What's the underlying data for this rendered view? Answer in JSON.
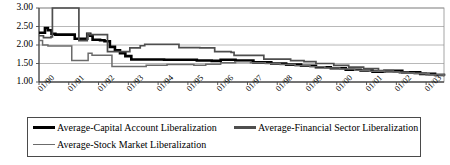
{
  "chart_data": {
    "type": "line",
    "title": "",
    "xlabel": "",
    "ylabel": "",
    "ylim": [
      1.0,
      3.0
    ],
    "ytick_labels": [
      "3.00",
      "2.50",
      "2.00",
      "1.50",
      "1.00"
    ],
    "ytick_values": [
      3.0,
      2.5,
      2.0,
      1.5,
      1.0
    ],
    "grid": "horizontal",
    "legend_position": "bottom",
    "x_axis_type": "monthly-date",
    "xtick_labels": [
      "01/90",
      "01/91",
      "01/92",
      "01/93",
      "01/94",
      "01/95",
      "01/96",
      "01/97",
      "01/98",
      "01/99",
      "01/00",
      "01/01",
      "01/02",
      "01/03"
    ],
    "xtick_values": [
      1990.0,
      1991.0,
      1992.0,
      1993.0,
      1994.0,
      1995.0,
      1996.0,
      1997.0,
      1998.0,
      1999.0,
      2000.0,
      2001.0,
      2002.0,
      2003.0
    ],
    "xlim": [
      1990.0,
      2003.6
    ],
    "series": [
      {
        "name": "Average-Capital Account Liberalization",
        "color": "#000000",
        "width": 2.6,
        "x": [
          1990.0,
          1990.2,
          1990.3,
          1990.42,
          1990.55,
          1991.1,
          1991.2,
          1991.55,
          1991.62,
          1991.72,
          1991.8,
          1992.05,
          1992.2,
          1992.38,
          1992.55,
          1992.72,
          1992.9,
          1993.1,
          1994.2,
          1995.3,
          1995.8,
          1996.1,
          1996.6,
          1997.2,
          1997.8,
          1998.3,
          1998.8,
          1999.3,
          1999.8,
          2000.3,
          2000.8,
          2001.2,
          2001.6,
          2001.9,
          2002.2,
          2002.8,
          2003.3,
          2003.6
        ],
        "y": [
          2.33,
          2.46,
          2.4,
          2.3,
          2.28,
          2.28,
          2.17,
          2.17,
          2.3,
          2.25,
          2.14,
          2.13,
          2.1,
          1.95,
          1.86,
          1.78,
          1.7,
          1.61,
          1.6,
          1.58,
          1.57,
          1.6,
          1.58,
          1.53,
          1.5,
          1.47,
          1.44,
          1.4,
          1.37,
          1.33,
          1.31,
          1.28,
          1.3,
          1.3,
          1.26,
          1.22,
          1.19,
          1.17
        ]
      },
      {
        "name": "Average-Financial Sector Liberalization",
        "color": "#4e4e4e",
        "width": 1.7,
        "x": [
          1990.0,
          1990.15,
          1990.4,
          1990.45,
          1991.28,
          1991.34,
          1991.5,
          1991.62,
          1991.7,
          1992.2,
          1992.3,
          1992.95,
          1993.05,
          1993.4,
          1993.55,
          1994.55,
          1994.7,
          1995.2,
          1995.4,
          1995.9,
          1996.05,
          1996.45,
          1996.55,
          1997.4,
          1997.55,
          1998.2,
          1998.45,
          1998.9,
          1999.3,
          1999.9,
          2000.4,
          2000.9,
          2001.4,
          2001.9,
          2002.4,
          2003.0,
          2003.6
        ],
        "y": [
          2.25,
          2.2,
          2.22,
          3.0,
          3.0,
          2.12,
          2.12,
          2.3,
          2.28,
          2.28,
          1.82,
          1.82,
          1.92,
          1.98,
          2.02,
          2.02,
          1.93,
          1.93,
          1.92,
          1.82,
          1.82,
          1.8,
          1.72,
          1.72,
          1.62,
          1.62,
          1.58,
          1.55,
          1.5,
          1.45,
          1.4,
          1.36,
          1.31,
          1.27,
          1.24,
          1.2,
          1.17
        ]
      },
      {
        "name": "Average-Stock Market Liberalization",
        "color": "#6b6b6b",
        "width": 1.5,
        "x": [
          1990.0,
          1990.12,
          1990.3,
          1990.95,
          1991.1,
          1991.55,
          1991.65,
          1991.78,
          1991.95,
          1992.3,
          1992.45,
          1993.1,
          1993.6,
          1994.3,
          1994.8,
          1995.2,
          1995.6,
          1996.1,
          1996.6,
          1997.1,
          1997.6,
          1998.1,
          1998.6,
          1999.1,
          1999.6,
          2000.1,
          2000.6,
          2001.1,
          2001.6,
          2002.1,
          2002.6,
          2003.1,
          2003.6
        ],
        "y": [
          2.12,
          2.0,
          1.97,
          1.97,
          1.58,
          1.58,
          1.78,
          1.72,
          1.72,
          1.72,
          1.42,
          1.42,
          1.45,
          1.47,
          1.47,
          1.45,
          1.48,
          1.52,
          1.55,
          1.52,
          1.5,
          1.47,
          1.44,
          1.41,
          1.38,
          1.35,
          1.32,
          1.29,
          1.27,
          1.24,
          1.22,
          1.19,
          1.15
        ]
      }
    ]
  },
  "legend": {
    "entries": [
      {
        "label": "Average-Capital Account Liberalization"
      },
      {
        "label": "Average-Financial Sector Liberalization"
      },
      {
        "label": "Average-Stock Market Liberalization"
      }
    ]
  }
}
